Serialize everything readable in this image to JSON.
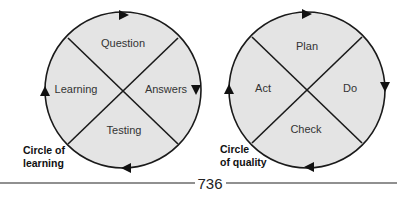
{
  "diagrams": [
    {
      "id": "learning",
      "caption": [
        "Circle of",
        "learning"
      ],
      "segments": {
        "top": "Question",
        "right": "Answers",
        "bottom": "Testing",
        "left": "Learning"
      },
      "direction": "clockwise"
    },
    {
      "id": "quality",
      "caption": [
        "Circle",
        "of quality"
      ],
      "segments": {
        "top": "Plan",
        "right": "Do",
        "bottom": "Check",
        "left": "Act"
      },
      "direction": "clockwise"
    }
  ],
  "colors": {
    "fill": "#e4e4e4",
    "stroke": "#1a1a1a",
    "text": "#333333"
  },
  "footer": {
    "page_number": "736"
  }
}
